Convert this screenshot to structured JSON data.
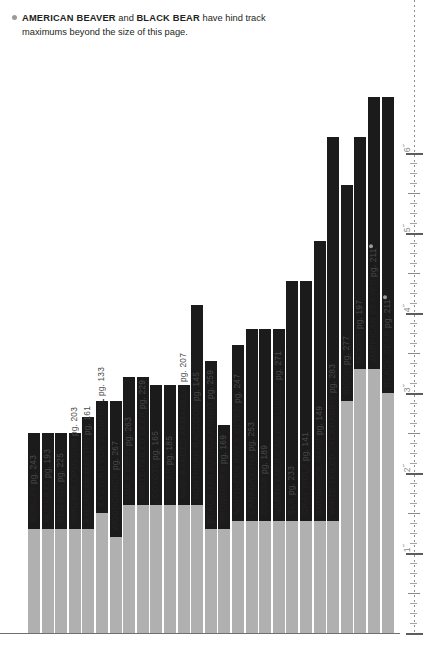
{
  "note": {
    "bullet": "bullet-dot",
    "species_a": "AMERICAN BEAVER",
    "conj": " and ",
    "species_b": "BLACK BEAR",
    "tail": " have hind track",
    "line2": "maximums beyond the size of this page."
  },
  "axis": {
    "unit": "inch",
    "ticks": [
      "1˝",
      "2˝",
      "3˝",
      "4˝",
      "5˝",
      "6˝"
    ],
    "values": [
      1,
      2,
      3,
      4,
      5,
      6
    ],
    "position": "right",
    "style": "dotted-ruler"
  },
  "colors": {
    "max_bar": "#1b1b1b",
    "min_bar": "#b0b0b0",
    "baseline": "#6f6f6f",
    "ruler": "#8d8d8d",
    "bullet": "#9a9a9a",
    "text": "#231f20"
  },
  "chart_data": {
    "type": "bar",
    "xlabel": "",
    "ylabel": "Track length (inches)",
    "ylim": [
      0,
      6.6
    ],
    "grid": false,
    "legend": "none",
    "note_overflow": [
      "AMERICAN BEAVER",
      "BLACK BEAR"
    ],
    "categories": [
      "BOBCAT",
      "MUSKRAT",
      "RED FOX",
      "VIRGINIA OPOSSUM",
      "AMERICAN MARTEN",
      "EASTERN FOX SQUIRREL",
      "WOODCHUCK",
      "MULE DEER",
      "WHITE-TAILED DEER",
      "COYOTE",
      "FISHER",
      "NINE-BANDED ARMADILLO",
      "NORTHERN RACCOON",
      "BLACK-TAILED JACKRABBIT",
      "PRONGHORN",
      "NORTHERN RIVER OTTER",
      "CANADA LYNX",
      "COUGAR",
      "NORTH AMERICAN PORCUPINE",
      "ELK",
      "GRAY WOLF",
      "SNOWSHOE HARE",
      "WHITE-TAILED JACKRABBIT",
      "BISON",
      "MOOSE",
      "AMERICAN BEAVER",
      "BLACK BEAR"
    ],
    "pages": [
      243,
      193,
      225,
      203,
      161,
      133,
      267,
      263,
      229,
      165,
      185,
      207,
      145,
      259,
      169,
      247,
      253,
      189,
      271,
      233,
      141,
      149,
      283,
      277,
      197,
      211
    ],
    "bars": [
      {
        "name": "BOBCAT",
        "page": 243,
        "min": 1.3,
        "max": 2.5,
        "overflow": false,
        "marked": false
      },
      {
        "name": "MUSKRAT",
        "page": 193,
        "min": 1.3,
        "max": 2.5,
        "overflow": false,
        "marked": false
      },
      {
        "name": "RED FOX",
        "page": 225,
        "min": 1.3,
        "max": 2.5,
        "overflow": false,
        "marked": false
      },
      {
        "name": "VIRGINIA OPOSSUM",
        "page": 203,
        "min": 1.3,
        "max": 2.5,
        "overflow": false,
        "marked": false
      },
      {
        "name": "AMERICAN MARTEN",
        "page": 161,
        "min": 1.3,
        "max": 2.7,
        "overflow": false,
        "marked": false
      },
      {
        "name": "EASTERN FOX SQUIRREL",
        "page": 133,
        "min": 1.5,
        "max": 2.9,
        "overflow": false,
        "marked": false
      },
      {
        "name": "WOODCHUCK",
        "page": 267,
        "min": 1.2,
        "max": 2.9,
        "overflow": false,
        "marked": false
      },
      {
        "name": "MULE DEER",
        "page": 263,
        "min": 1.6,
        "max": 3.2,
        "overflow": false,
        "marked": false
      },
      {
        "name": "WHITE-TAILED DEER",
        "page": 229,
        "min": 1.6,
        "max": 3.2,
        "overflow": false,
        "marked": false
      },
      {
        "name": "COYOTE",
        "page": 165,
        "min": 1.6,
        "max": 3.1,
        "overflow": false,
        "marked": false
      },
      {
        "name": "FISHER",
        "page": 185,
        "min": 1.6,
        "max": 3.1,
        "overflow": false,
        "marked": false
      },
      {
        "name": "NINE-BANDED ARMADILLO",
        "page": 207,
        "min": 1.6,
        "max": 3.1,
        "overflow": false,
        "marked": false
      },
      {
        "name": "NORTHERN RACCOON",
        "page": 145,
        "min": 1.6,
        "max": 4.1,
        "overflow": false,
        "marked": false
      },
      {
        "name": "BLACK-TAILED JACKRABBIT",
        "page": 259,
        "min": 1.3,
        "max": 3.4,
        "overflow": false,
        "marked": false
      },
      {
        "name": "PRONGHORN",
        "page": 169,
        "min": 1.3,
        "max": 2.6,
        "overflow": false,
        "marked": false
      },
      {
        "name": "NORTHERN RIVER OTTER",
        "page": 247,
        "min": 1.4,
        "max": 3.6,
        "overflow": false,
        "marked": false
      },
      {
        "name": "CANADA LYNX",
        "page": 253,
        "min": 1.4,
        "max": 3.8,
        "overflow": false,
        "marked": false
      },
      {
        "name": "COUGAR",
        "page": 189,
        "min": 1.4,
        "max": 3.8,
        "overflow": false,
        "marked": false
      },
      {
        "name": "NORTH AMERICAN PORCUPINE",
        "page": 271,
        "min": 1.4,
        "max": 3.8,
        "overflow": false,
        "marked": false
      },
      {
        "name": "ELK",
        "page": 233,
        "min": 1.4,
        "max": 4.4,
        "overflow": false,
        "marked": false
      },
      {
        "name": "GRAY WOLF",
        "page": 141,
        "min": 1.4,
        "max": 4.4,
        "overflow": false,
        "marked": false
      },
      {
        "name": "SNOWSHOE HARE",
        "page": 149,
        "min": 1.4,
        "max": 4.9,
        "overflow": false,
        "marked": false
      },
      {
        "name": "WHITE-TAILED JACKRABBIT",
        "page": 283,
        "min": 1.4,
        "max": 6.2,
        "overflow": false,
        "marked": false
      },
      {
        "name": "BISON",
        "page": 277,
        "min": 2.9,
        "max": 5.6,
        "overflow": false,
        "marked": false
      },
      {
        "name": "MOOSE",
        "page": 197,
        "min": 3.3,
        "max": 6.2,
        "overflow": false,
        "marked": false
      },
      {
        "name": "AMERICAN BEAVER",
        "page": 211,
        "min": 3.3,
        "max": 6.7,
        "overflow": true,
        "marked": true
      },
      {
        "name": "BLACK BEAR",
        "page": 211,
        "min": 3.0,
        "max": 6.7,
        "overflow": true,
        "marked": true
      }
    ]
  }
}
